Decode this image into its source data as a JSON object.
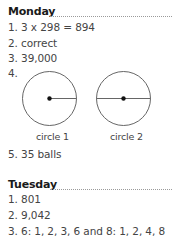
{
  "monday": {
    "heading": "Monday",
    "answers": [
      "1. 3 x 298 = 894",
      "2. correct",
      "3. 39,000",
      "4.",
      "5. 35 balls"
    ],
    "circles": [
      {
        "label": "circle 1",
        "line": "radius"
      },
      {
        "label": "circle 2",
        "line": "diameter"
      }
    ]
  },
  "tuesday": {
    "heading": "Tuesday",
    "answers": [
      "1. 801",
      "2. 9,042",
      "3. 6: 1, 2, 3, 6 and 8: 1, 2, 4, 8"
    ]
  },
  "colors": {
    "text": "#444444",
    "heading": "#1a1a1a",
    "dots": "#9a9a9a",
    "circle_stroke": "#555555"
  }
}
